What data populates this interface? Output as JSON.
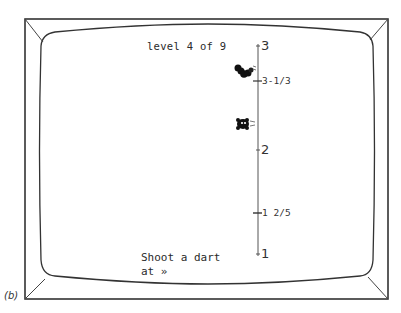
{
  "game": {
    "level_text": "level 4 of 9",
    "prompt_line1": "Shoot a dart",
    "prompt_line2": "at »",
    "caption": "(b)"
  },
  "number_line": {
    "ticks": [
      {
        "label": "3",
        "value": 3
      },
      {
        "label": "2",
        "value": 2
      },
      {
        "label": "1",
        "value": 1
      }
    ],
    "markers": [
      {
        "label": "3-1/3",
        "value": 2.6667
      },
      {
        "label": "1 2/5",
        "value": 1.4
      }
    ]
  },
  "targets": [
    {
      "name": "worm",
      "position_value": 2.75
    },
    {
      "name": "bug",
      "position_value": 2.25
    }
  ],
  "colors": {
    "ink": "#2a2a2a",
    "background": "#ffffff"
  }
}
